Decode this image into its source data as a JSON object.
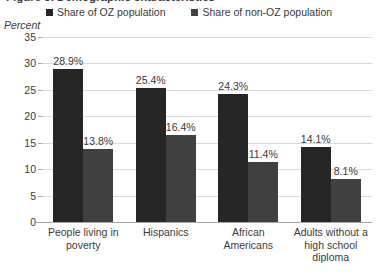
{
  "title": {
    "clipped_text": "Figure 3. Demographic characteristics"
  },
  "legend": {
    "position": "top",
    "items": [
      {
        "label": "Share of OZ population",
        "color": "#262626",
        "marker": "square-marker-icon"
      },
      {
        "label": "Share of non-OZ population",
        "color": "#404040",
        "marker": "square-marker-icon"
      }
    ]
  },
  "axis": {
    "y_title": "Percent",
    "y_ticks": [
      "35",
      "30",
      "25",
      "20",
      "15",
      "10",
      "5",
      "0"
    ]
  },
  "chart_data": {
    "type": "bar",
    "title": "Figure 3. Demographic characteristics",
    "xlabel": "",
    "ylabel": "Percent",
    "ylim": [
      0,
      35
    ],
    "ytick_step": 5,
    "grid": true,
    "legend_position": "top",
    "categories": [
      "People living in poverty",
      "Hispanics",
      "African Americans",
      "Adults without a high school diploma"
    ],
    "series": [
      {
        "name": "Share of OZ population",
        "color": "#262626",
        "values": [
          28.9,
          25.4,
          24.3,
          14.1
        ],
        "labels": [
          "28.9%",
          "25.4%",
          "24.3%",
          "14.1%"
        ]
      },
      {
        "name": "Share of non-OZ population",
        "color": "#404040",
        "values": [
          13.8,
          16.4,
          11.4,
          8.1
        ],
        "labels": [
          "13.8%",
          "16.4%",
          "11.4%",
          "8.1%"
        ]
      }
    ]
  },
  "category_lines": [
    [
      "People living in",
      "poverty"
    ],
    [
      "Hispanics"
    ],
    [
      "African",
      "Americans"
    ],
    [
      "Adults without a",
      "high school",
      "diploma"
    ]
  ]
}
